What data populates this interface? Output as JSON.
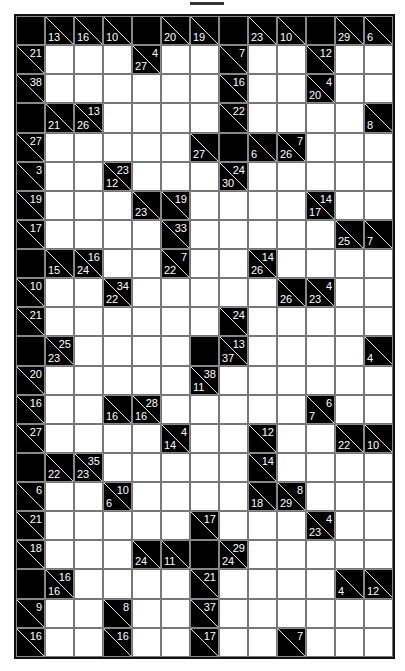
{
  "puzzle": {
    "type": "kakuro",
    "cols": 13,
    "rows": 22,
    "legend": "Each clue cell: 'a' = across sum (top-right), 'd' = down sum (bottom-left). 'B' = blank black, 'W' = white entry cell.",
    "grid": [
      [
        "B",
        {
          "d": 13
        },
        {
          "d": 16
        },
        {
          "d": 10
        },
        "B",
        {
          "d": 20
        },
        {
          "d": 19
        },
        "B",
        {
          "d": 23
        },
        {
          "d": 10
        },
        "B",
        {
          "d": 29
        },
        {
          "d": 6
        }
      ],
      [
        {
          "a": 21
        },
        "W",
        "W",
        "W",
        {
          "a": 4,
          "d": 27
        },
        "W",
        "W",
        {
          "a": 7
        },
        "W",
        "W",
        {
          "a": 12
        },
        "W",
        "W"
      ],
      [
        {
          "a": 38
        },
        "W",
        "W",
        "W",
        "W",
        "W",
        "W",
        {
          "a": 16
        },
        "W",
        "W",
        {
          "a": 4,
          "d": 20
        },
        "W",
        "W"
      ],
      [
        "B",
        {
          "d": 21
        },
        {
          "a": 13,
          "d": 26
        },
        "W",
        "W",
        "W",
        "W",
        {
          "a": 22
        },
        "W",
        "W",
        "W",
        "W",
        {
          "d": 8
        }
      ],
      [
        {
          "a": 27
        },
        "W",
        "W",
        "W",
        "W",
        "W",
        {
          "d": 27
        },
        "B",
        {
          "d": 6
        },
        {
          "a": 7,
          "d": 26
        },
        "W",
        "W",
        "W"
      ],
      [
        {
          "a": 3
        },
        "W",
        "W",
        {
          "a": 23,
          "d": 12
        },
        "W",
        "W",
        "W",
        {
          "a": 24,
          "d": 30
        },
        "W",
        "W",
        "W",
        "W",
        "W"
      ],
      [
        {
          "a": 19
        },
        "W",
        "W",
        "W",
        {
          "d": 23
        },
        {
          "a": 19
        },
        "W",
        "W",
        "W",
        "W",
        {
          "a": 14,
          "d": 17
        },
        "W",
        "W"
      ],
      [
        {
          "a": 17
        },
        "W",
        "W",
        "W",
        "W",
        {
          "a": 33
        },
        "W",
        "W",
        "W",
        "W",
        "W",
        {
          "d": 25
        },
        {
          "d": 7
        }
      ],
      [
        "B",
        {
          "d": 15
        },
        {
          "a": 16,
          "d": 24
        },
        "W",
        "W",
        {
          "a": 7,
          "d": 22
        },
        "W",
        "W",
        {
          "a": 14,
          "d": 26
        },
        "W",
        "W",
        "W",
        "W"
      ],
      [
        {
          "a": 10
        },
        "W",
        "W",
        {
          "a": 34,
          "d": 22
        },
        "W",
        "W",
        "W",
        "W",
        "W",
        {
          "d": 26
        },
        {
          "a": 4,
          "d": 23
        },
        "W",
        "W"
      ],
      [
        {
          "a": 21
        },
        "W",
        "W",
        "W",
        "W",
        "W",
        "W",
        {
          "a": 24
        },
        "W",
        "W",
        "W",
        "W",
        "W"
      ],
      [
        "B",
        {
          "a": 25,
          "d": 23
        },
        "W",
        "W",
        "W",
        "W",
        "B",
        {
          "a": 13,
          "d": 37
        },
        "W",
        "W",
        "W",
        "W",
        {
          "d": 4
        }
      ],
      [
        {
          "a": 20
        },
        "W",
        "W",
        "W",
        "W",
        "W",
        {
          "a": 38,
          "d": 11
        },
        "W",
        "W",
        "W",
        "W",
        "W",
        "W"
      ],
      [
        {
          "a": 16
        },
        "W",
        "W",
        {
          "d": 16
        },
        {
          "a": 28,
          "d": 16
        },
        "W",
        "W",
        "W",
        "W",
        "W",
        {
          "a": 6,
          "d": 7
        },
        "W",
        "W"
      ],
      [
        {
          "a": 27
        },
        "W",
        "W",
        "W",
        "W",
        {
          "a": 4,
          "d": 14
        },
        "W",
        "W",
        {
          "a": 12
        },
        "W",
        "W",
        {
          "d": 22
        },
        {
          "d": 10
        }
      ],
      [
        "B",
        {
          "d": 22
        },
        {
          "a": 35,
          "d": 23
        },
        "W",
        "W",
        "W",
        "W",
        "W",
        {
          "a": 14
        },
        "W",
        "W",
        "W",
        "W"
      ],
      [
        {
          "a": 6
        },
        "W",
        "W",
        {
          "a": 10,
          "d": 6
        },
        "W",
        "W",
        "W",
        "W",
        {
          "d": 18
        },
        {
          "a": 8,
          "d": 29
        },
        "W",
        "W",
        "W"
      ],
      [
        {
          "a": 21
        },
        "W",
        "W",
        "W",
        "W",
        "W",
        {
          "a": 17
        },
        "W",
        "W",
        "W",
        {
          "a": 4,
          "d": 23
        },
        "W",
        "W"
      ],
      [
        {
          "a": 18
        },
        "W",
        "W",
        "W",
        {
          "d": 24
        },
        {
          "d": 11
        },
        "B",
        {
          "a": 29,
          "d": 24
        },
        "W",
        "W",
        "W",
        "W",
        "W"
      ],
      [
        "B",
        {
          "a": 16,
          "d": 16
        },
        "W",
        "W",
        "W",
        "W",
        {
          "a": 21
        },
        "W",
        "W",
        "W",
        "W",
        {
          "d": 4
        },
        {
          "d": 12
        }
      ],
      [
        {
          "a": 9
        },
        "W",
        "W",
        {
          "a": 8
        },
        "W",
        "W",
        {
          "a": 37
        },
        "W",
        "W",
        "W",
        "W",
        "W",
        "W"
      ],
      [
        {
          "a": 16
        },
        "W",
        "W",
        {
          "a": 16
        },
        "W",
        "W",
        {
          "a": 17
        },
        "W",
        "W",
        {
          "a": 7
        },
        "W",
        "W",
        "W"
      ]
    ]
  }
}
